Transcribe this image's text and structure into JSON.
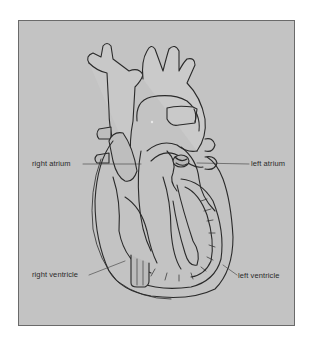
{
  "figure": {
    "background_color": "#c3c3c3",
    "border_color": "#6a6a6a",
    "line_color": "#2a2a2a"
  },
  "labels": {
    "right_atrium": "right atrium",
    "left_atrium": "left atrium",
    "right_ventricle": "right ventricle",
    "left_ventricle": "left ventricle"
  }
}
